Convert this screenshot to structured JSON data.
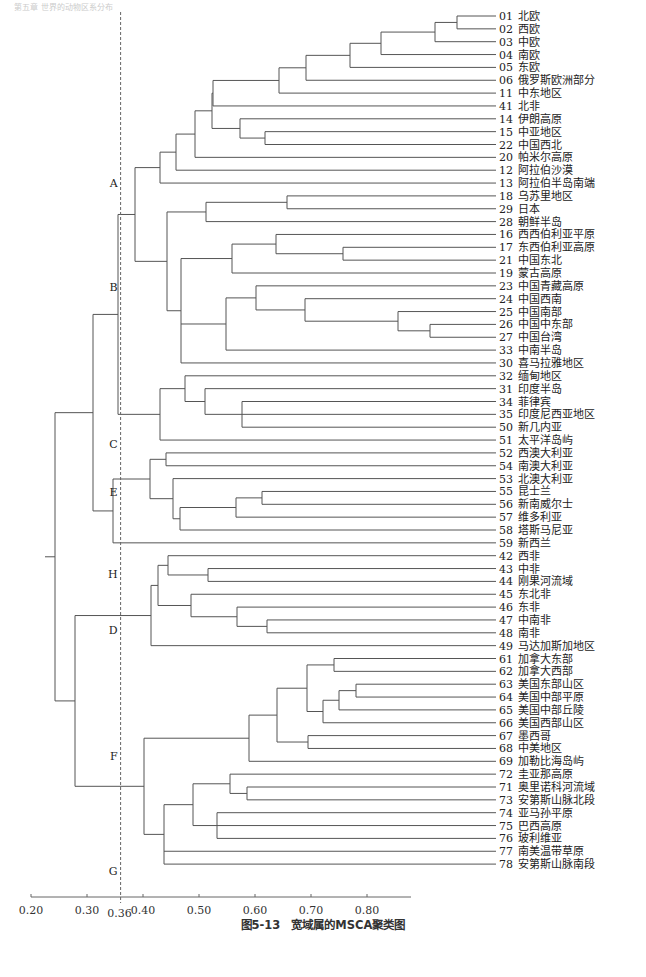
{
  "header_faint": "第五章 世界的动物区系分布",
  "caption": "图5-13　宽域属的MSCA聚类图",
  "chart_data": {
    "type": "dendrogram",
    "title": "图5-13　宽域属的MSCA聚类图",
    "xlabel": "",
    "ylabel": "",
    "x_ticks": [
      "0.20",
      "0.30",
      "0.36",
      "0.40",
      "0.50",
      "0.60",
      "0.70",
      "0.80"
    ],
    "x_tick_values": [
      0.2,
      0.3,
      0.36,
      0.4,
      0.5,
      0.6,
      0.7,
      0.8
    ],
    "xlim": [
      0.2,
      0.88
    ],
    "cut_line": 0.36,
    "grid": false,
    "leaves": [
      {
        "id": "01",
        "name": "北欧"
      },
      {
        "id": "02",
        "name": "西欧"
      },
      {
        "id": "03",
        "name": "中欧"
      },
      {
        "id": "04",
        "name": "南欧"
      },
      {
        "id": "05",
        "name": "东欧"
      },
      {
        "id": "06",
        "name": "俄罗斯欧洲部分"
      },
      {
        "id": "11",
        "name": "中东地区"
      },
      {
        "id": "41",
        "name": "北非"
      },
      {
        "id": "14",
        "name": "伊朗高原"
      },
      {
        "id": "15",
        "name": "中亚地区"
      },
      {
        "id": "22",
        "name": "中国西北"
      },
      {
        "id": "20",
        "name": "帕米尔高原"
      },
      {
        "id": "12",
        "name": "阿拉伯沙漠"
      },
      {
        "id": "13",
        "name": "阿拉伯半岛南端"
      },
      {
        "id": "18",
        "name": "乌苏里地区"
      },
      {
        "id": "29",
        "name": "日本"
      },
      {
        "id": "28",
        "name": "朝鲜半岛"
      },
      {
        "id": "16",
        "name": "西西伯利亚平原"
      },
      {
        "id": "17",
        "name": "东西伯利亚高原"
      },
      {
        "id": "21",
        "name": "中国东北"
      },
      {
        "id": "19",
        "name": "蒙古高原"
      },
      {
        "id": "23",
        "name": "中国青藏高原"
      },
      {
        "id": "24",
        "name": "中国西南"
      },
      {
        "id": "25",
        "name": "中国南部"
      },
      {
        "id": "26",
        "name": "中国中东部"
      },
      {
        "id": "27",
        "name": "中国台湾"
      },
      {
        "id": "33",
        "name": "中南半岛"
      },
      {
        "id": "30",
        "name": "喜马拉雅地区"
      },
      {
        "id": "32",
        "name": "缅甸地区"
      },
      {
        "id": "31",
        "name": "印度半岛"
      },
      {
        "id": "34",
        "name": "菲律宾"
      },
      {
        "id": "35",
        "name": "印度尼西亚地区"
      },
      {
        "id": "50",
        "name": "新几内亚"
      },
      {
        "id": "51",
        "name": "太平洋岛屿"
      },
      {
        "id": "52",
        "name": "西澳大利亚"
      },
      {
        "id": "54",
        "name": "南澳大利亚"
      },
      {
        "id": "53",
        "name": "北澳大利亚"
      },
      {
        "id": "55",
        "name": "昆士兰"
      },
      {
        "id": "56",
        "name": "新南威尔士"
      },
      {
        "id": "57",
        "name": "维多利亚"
      },
      {
        "id": "58",
        "name": "塔斯马尼亚"
      },
      {
        "id": "59",
        "name": "新西兰"
      },
      {
        "id": "42",
        "name": "西非"
      },
      {
        "id": "43",
        "name": "中非"
      },
      {
        "id": "44",
        "name": "刚果河流域"
      },
      {
        "id": "45",
        "name": "东北非"
      },
      {
        "id": "46",
        "name": "东非"
      },
      {
        "id": "47",
        "name": "中南非"
      },
      {
        "id": "48",
        "name": "南非"
      },
      {
        "id": "49",
        "name": "马达加斯加地区"
      },
      {
        "id": "61",
        "name": "加拿大东部"
      },
      {
        "id": "62",
        "name": "加拿大西部"
      },
      {
        "id": "63",
        "name": "美国东部山区"
      },
      {
        "id": "64",
        "name": "美国中部平原"
      },
      {
        "id": "65",
        "name": "美国中部丘陵"
      },
      {
        "id": "66",
        "name": "美国西部山区"
      },
      {
        "id": "67",
        "name": "墨西哥"
      },
      {
        "id": "68",
        "name": "中美地区"
      },
      {
        "id": "69",
        "name": "加勒比海岛屿"
      },
      {
        "id": "72",
        "name": "圭亚那高原"
      },
      {
        "id": "71",
        "name": "奥里诺科河流域"
      },
      {
        "id": "73",
        "name": "安第斯山脉北段"
      },
      {
        "id": "74",
        "name": "亚马孙平原"
      },
      {
        "id": "75",
        "name": "巴西高原"
      },
      {
        "id": "76",
        "name": "玻利维亚"
      },
      {
        "id": "77",
        "name": "南美温带草原"
      },
      {
        "id": "78",
        "name": "安第斯山脉南段"
      }
    ],
    "tree": [
      0.225,
      [
        0.245,
        [
          0.312,
          [
            0.357,
            [
              0.39,
              [
                0.435,
                [
                  0.525,
                  [
                    0.633,
                    [
                      0.677,
                      [
                        0.757,
                        [
                          0.812,
                          [
                            0.86,
                            0,
                            1
                          ],
                          2
                        ],
                        3
                      ],
                      4
                    ],
                    5
                  ],
                  6
                ],
                7
              ],
              [
                0.46,
                8,
                [
                  0.615,
                  9,
                  10
                ]
              ]
            ],
            11
          ],
          12
        ],
        13
      ],
      null
    ],
    "clusters": [
      {
        "label": "A",
        "leaves": [
          "01",
          "13"
        ]
      },
      {
        "label": "B",
        "leaves": [
          "18",
          "30"
        ]
      },
      {
        "label": "C",
        "leaves": [
          "32",
          "51"
        ]
      },
      {
        "label": "E",
        "leaves": [
          "52",
          "58"
        ]
      },
      {
        "label": "H",
        "leaves": [
          "59",
          "59"
        ]
      },
      {
        "label": "D",
        "leaves": [
          "42",
          "49"
        ]
      },
      {
        "label": "F",
        "leaves": [
          "61",
          "69"
        ]
      },
      {
        "label": "G",
        "leaves": [
          "72",
          "78"
        ]
      }
    ],
    "merges": [
      {
        "h": 0.86,
        "a": 0,
        "b": 1
      },
      {
        "h": 0.812,
        "a": "n0",
        "b": 2
      },
      {
        "h": 0.757,
        "a": "n1",
        "b": 3
      },
      {
        "h": 0.677,
        "a": "n2",
        "b": 4
      },
      {
        "h": 0.633,
        "a": "n3",
        "b": 5
      },
      {
        "h": 0.545,
        "a": "n4",
        "b": 6
      },
      {
        "h": 0.425,
        "a": "n5",
        "b": 7
      },
      {
        "h": 0.595,
        "a": 9,
        "b": 10
      },
      {
        "h": 0.478,
        "a": 8,
        "b": "n7"
      },
      {
        "h": 0.425,
        "a": "n6",
        "b": "n8"
      },
      {
        "h": 0.394,
        "a": "n9",
        "b": 11
      },
      {
        "h": 0.36,
        "a": "n10",
        "b": 12
      },
      {
        "h": 0.331,
        "a": "n11",
        "b": 13
      },
      {
        "h": 0.655,
        "a": 14,
        "b": 15
      },
      {
        "h": 0.513,
        "a": "n13",
        "b": 16
      },
      {
        "h": 0.733,
        "a": 18,
        "b": 19
      },
      {
        "h": 0.64,
        "a": 17,
        "b": "n15"
      },
      {
        "h": 0.558,
        "a": "n16",
        "b": 20
      },
      {
        "h": 0.802,
        "a": 24,
        "b": 25
      },
      {
        "h": 0.695,
        "a": 23,
        "b": "n18"
      },
      {
        "h": 0.599,
        "a": 22,
        "b": "n19"
      },
      {
        "h": 0.56,
        "a": 21,
        "b": "n20"
      },
      {
        "h": 0.527,
        "a": "n21",
        "b": 26
      },
      {
        "h": 0.487,
        "a": "n22",
        "b": 27
      },
      {
        "h": 0.409,
        "a": "n17",
        "b": "n23"
      },
      {
        "h": 0.384,
        "a": "n14",
        "b": "n24"
      },
      {
        "h": 0.339,
        "a": "n12",
        "b": "n25"
      },
      {
        "h": 0.578,
        "a": 31,
        "b": 32
      },
      {
        "h": 0.578,
        "a": 30,
        "b": "n27"
      },
      {
        "h": 0.511,
        "a": 29,
        "b": "n28"
      },
      {
        "h": 0.475,
        "a": 28,
        "b": "n29"
      },
      {
        "h": 0.376,
        "a": "n30",
        "b": 33
      },
      {
        "h": 0.311,
        "a": "n26",
        "b": "n31"
      },
      {
        "h": 0.386,
        "a": 34,
        "b": 35
      },
      {
        "h": 0.612,
        "a": 37,
        "b": 38
      },
      {
        "h": 0.566,
        "a": "n33",
        "b": 39
      },
      {
        "h": 0.472,
        "a": "n34",
        "b": 40
      },
      {
        "h": 0.4,
        "a": 36,
        "b": "n35"
      },
      {
        "h": 0.364,
        "a": "n32b",
        "b": "n36"
      },
      {
        "h": 0.324,
        "a": "n37",
        "b": 41
      },
      {
        "h": 0.28,
        "a": "n32",
        "b": "n38"
      },
      {
        "h": 0.56,
        "a": 43,
        "b": 44
      },
      {
        "h": 0.5,
        "a": 42,
        "b": "n40"
      },
      {
        "h": 0.628,
        "a": 47,
        "b": 48
      },
      {
        "h": 0.577,
        "a": 46,
        "b": "n42"
      },
      {
        "h": 0.5,
        "a": 45,
        "b": "n43"
      },
      {
        "h": 0.385,
        "a": "n41",
        "b": "n44"
      },
      {
        "h": 0.366,
        "a": "n45",
        "b": 49
      },
      {
        "h": 0.69,
        "a": 50,
        "b": 51
      },
      {
        "h": 0.708,
        "a": 52,
        "b": 53
      },
      {
        "h": 0.659,
        "a": "n47",
        "b": 54
      },
      {
        "h": 0.615,
        "a": "n48",
        "b": 55
      },
      {
        "h": 0.591,
        "a": "n46",
        "b": "n49"
      },
      {
        "h": 0.65,
        "a": 56,
        "b": 57
      },
      {
        "h": 0.558,
        "a": "n50",
        "b": "n51"
      },
      {
        "h": 0.51,
        "a": "n52",
        "b": 58
      },
      {
        "h": 0.581,
        "a": 60,
        "b": 61
      },
      {
        "h": 0.492,
        "a": 59,
        "b": "n54"
      },
      {
        "h": 0.538,
        "a": 62,
        "b": 63
      },
      {
        "h": 0.538,
        "a": "n56",
        "b": 64
      },
      {
        "h": 0.44,
        "a": "n55",
        "b": "n57"
      },
      {
        "h": 0.392,
        "a": "n58",
        "b": 65
      },
      {
        "h": 0.378,
        "a": "n59",
        "b": 66
      },
      {
        "h": 0.351,
        "a": "n53",
        "b": "n60"
      },
      {
        "h": 0.255,
        "a": "n46x",
        "b": "n61"
      },
      {
        "h": 0.242,
        "a": "n39",
        "b": "n62"
      }
    ]
  }
}
